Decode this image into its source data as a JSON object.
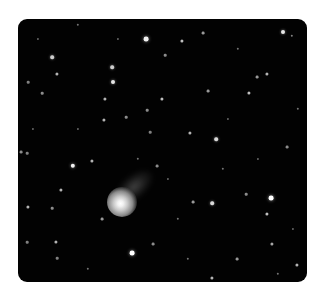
{
  "image": {
    "subject": "comet in star field",
    "frame": {
      "left": 18,
      "top": 19,
      "width": 289,
      "height": 263,
      "radius": 9
    },
    "colors": {
      "background": "#ffffff",
      "sky": "#020202",
      "star": "#ffffff"
    },
    "comet": {
      "nucleus_x": 104,
      "nucleus_y": 183,
      "coma_diameter": 30,
      "tail": {
        "x": 116,
        "y": 168,
        "width": 46,
        "height": 24
      }
    },
    "stars": [
      {
        "x": 128,
        "y": 20,
        "r": 2.4,
        "o": 0.95
      },
      {
        "x": 164,
        "y": 22,
        "r": 1.6,
        "o": 0.75
      },
      {
        "x": 185,
        "y": 14,
        "r": 1.4,
        "o": 0.6
      },
      {
        "x": 147,
        "y": 36,
        "r": 1.3,
        "o": 0.55
      },
      {
        "x": 265,
        "y": 13,
        "r": 2.0,
        "o": 0.9
      },
      {
        "x": 274,
        "y": 17,
        "r": 1.2,
        "o": 0.5
      },
      {
        "x": 94,
        "y": 48,
        "r": 1.8,
        "o": 0.8
      },
      {
        "x": 95,
        "y": 63,
        "r": 2.0,
        "o": 0.9
      },
      {
        "x": 87,
        "y": 80,
        "r": 1.6,
        "o": 0.7
      },
      {
        "x": 144,
        "y": 80,
        "r": 1.6,
        "o": 0.75
      },
      {
        "x": 86,
        "y": 101,
        "r": 1.6,
        "o": 0.7
      },
      {
        "x": 108,
        "y": 98,
        "r": 1.3,
        "o": 0.55
      },
      {
        "x": 129,
        "y": 91,
        "r": 1.3,
        "o": 0.55
      },
      {
        "x": 34,
        "y": 38,
        "r": 1.8,
        "o": 0.8
      },
      {
        "x": 39,
        "y": 55,
        "r": 1.6,
        "o": 0.7
      },
      {
        "x": 10,
        "y": 63,
        "r": 1.3,
        "o": 0.5
      },
      {
        "x": 24,
        "y": 74,
        "r": 1.3,
        "o": 0.55
      },
      {
        "x": 231,
        "y": 74,
        "r": 1.6,
        "o": 0.75
      },
      {
        "x": 239,
        "y": 58,
        "r": 1.4,
        "o": 0.6
      },
      {
        "x": 249,
        "y": 55,
        "r": 1.6,
        "o": 0.7
      },
      {
        "x": 190,
        "y": 72,
        "r": 1.4,
        "o": 0.6
      },
      {
        "x": 198,
        "y": 120,
        "r": 1.8,
        "o": 0.85
      },
      {
        "x": 172,
        "y": 114,
        "r": 1.6,
        "o": 0.7
      },
      {
        "x": 269,
        "y": 128,
        "r": 1.4,
        "o": 0.55
      },
      {
        "x": 132,
        "y": 113,
        "r": 1.3,
        "o": 0.5
      },
      {
        "x": 139,
        "y": 147,
        "r": 1.4,
        "o": 0.55
      },
      {
        "x": 55,
        "y": 147,
        "r": 2.2,
        "o": 0.95
      },
      {
        "x": 74,
        "y": 142,
        "r": 1.6,
        "o": 0.7
      },
      {
        "x": 3,
        "y": 133,
        "r": 1.4,
        "o": 0.55
      },
      {
        "x": 9,
        "y": 134,
        "r": 1.3,
        "o": 0.5
      },
      {
        "x": 10,
        "y": 188,
        "r": 1.6,
        "o": 0.7
      },
      {
        "x": 43,
        "y": 171,
        "r": 1.6,
        "o": 0.7
      },
      {
        "x": 34,
        "y": 189,
        "r": 1.3,
        "o": 0.55
      },
      {
        "x": 84,
        "y": 200,
        "r": 1.4,
        "o": 0.6
      },
      {
        "x": 38,
        "y": 223,
        "r": 1.6,
        "o": 0.7
      },
      {
        "x": 9,
        "y": 223,
        "r": 1.3,
        "o": 0.5
      },
      {
        "x": 39,
        "y": 239,
        "r": 1.3,
        "o": 0.5
      },
      {
        "x": 253,
        "y": 179,
        "r": 2.4,
        "o": 1.0
      },
      {
        "x": 249,
        "y": 195,
        "r": 1.6,
        "o": 0.75
      },
      {
        "x": 194,
        "y": 184,
        "r": 1.8,
        "o": 0.85
      },
      {
        "x": 175,
        "y": 183,
        "r": 1.4,
        "o": 0.6
      },
      {
        "x": 228,
        "y": 175,
        "r": 1.3,
        "o": 0.55
      },
      {
        "x": 114,
        "y": 234,
        "r": 2.4,
        "o": 1.0
      },
      {
        "x": 135,
        "y": 225,
        "r": 1.4,
        "o": 0.55
      },
      {
        "x": 219,
        "y": 240,
        "r": 1.4,
        "o": 0.6
      },
      {
        "x": 194,
        "y": 259,
        "r": 1.6,
        "o": 0.7
      },
      {
        "x": 254,
        "y": 225,
        "r": 1.6,
        "o": 0.65
      },
      {
        "x": 279,
        "y": 246,
        "r": 1.6,
        "o": 0.7
      },
      {
        "x": 60,
        "y": 6,
        "r": 1.2,
        "o": 0.45
      },
      {
        "x": 220,
        "y": 30,
        "r": 1.2,
        "o": 0.45
      },
      {
        "x": 280,
        "y": 90,
        "r": 1.2,
        "o": 0.45
      },
      {
        "x": 15,
        "y": 110,
        "r": 1.1,
        "o": 0.4
      },
      {
        "x": 160,
        "y": 200,
        "r": 1.2,
        "o": 0.45
      },
      {
        "x": 70,
        "y": 250,
        "r": 1.2,
        "o": 0.45
      },
      {
        "x": 240,
        "y": 140,
        "r": 1.1,
        "o": 0.4
      },
      {
        "x": 205,
        "y": 150,
        "r": 1.2,
        "o": 0.45
      },
      {
        "x": 120,
        "y": 140,
        "r": 1.2,
        "o": 0.45
      },
      {
        "x": 150,
        "y": 160,
        "r": 1.1,
        "o": 0.4
      },
      {
        "x": 170,
        "y": 240,
        "r": 1.2,
        "o": 0.45
      },
      {
        "x": 260,
        "y": 255,
        "r": 1.2,
        "o": 0.45
      },
      {
        "x": 100,
        "y": 20,
        "r": 1.1,
        "o": 0.4
      },
      {
        "x": 210,
        "y": 100,
        "r": 1.1,
        "o": 0.4
      },
      {
        "x": 60,
        "y": 110,
        "r": 1.1,
        "o": 0.4
      },
      {
        "x": 20,
        "y": 20,
        "r": 1.1,
        "o": 0.4
      },
      {
        "x": 275,
        "y": 210,
        "r": 1.1,
        "o": 0.4
      }
    ]
  }
}
